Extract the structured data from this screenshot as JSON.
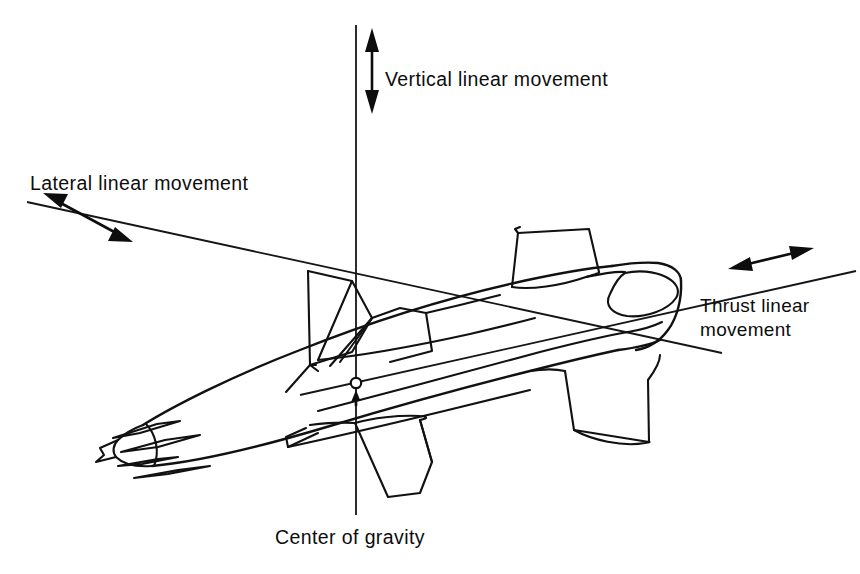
{
  "figure": {
    "type": "technical-line-diagram",
    "background_color": "#ffffff",
    "line_color": "#111111",
    "text_color": "#0d0d0d",
    "width": 860,
    "height": 574
  },
  "labels": {
    "vertical": "Vertical linear movement",
    "lateral": "Lateral linear movement",
    "thrust_line1": "Thrust linear",
    "thrust_line2": "movement",
    "center_of_gravity": "Center of gravity"
  },
  "axes": [
    {
      "name": "vertical-axis",
      "label": "Vertical linear movement",
      "orientation": "vertical",
      "arrow": "double-headed",
      "line_from": [
        356,
        25
      ],
      "line_to": [
        356,
        515
      ]
    },
    {
      "name": "lateral-axis",
      "label": "Lateral linear movement",
      "orientation": "diagonal-down-right",
      "arrow": "double-headed",
      "line_from": [
        27,
        202
      ],
      "line_to": [
        718,
        352
      ]
    },
    {
      "name": "thrust-axis",
      "label": "Thrust linear movement",
      "orientation": "diagonal-up-right",
      "arrow": "double-headed",
      "line_from": [
        352,
        383
      ],
      "line_to": [
        852,
        272
      ]
    }
  ],
  "markers": [
    {
      "name": "center-of-gravity-marker",
      "label": "Center of gravity",
      "shape": "open-circle-with-arrow",
      "position": [
        356,
        383
      ]
    }
  ]
}
